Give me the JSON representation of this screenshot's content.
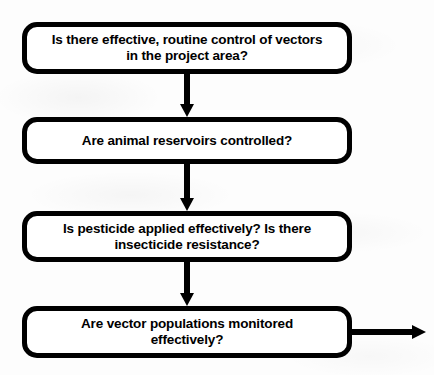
{
  "diagram": {
    "type": "flowchart",
    "background_color": "#fdfdfd",
    "stroke_color": "#000000",
    "fill_color": "#ffffff",
    "nodes": [
      {
        "id": "node-vector-control",
        "shape": "rounded-rectangle",
        "label": "Is there effective, routine control of vectors\nin the project area?",
        "x": 22,
        "y": 22,
        "width": 330,
        "height": 52
      },
      {
        "id": "node-animal-reservoirs",
        "shape": "rounded-rectangle",
        "label": "Are animal reservoirs controlled?",
        "x": 22,
        "y": 117,
        "width": 330,
        "height": 47
      },
      {
        "id": "node-pesticide-applied",
        "shape": "rounded-rectangle",
        "label": "Is pesticide applied effectively? Is there\ninsecticide resistance?",
        "x": 22,
        "y": 211,
        "width": 330,
        "height": 51
      },
      {
        "id": "node-vector-monitoring",
        "shape": "rounded-rectangle",
        "label": "Are vector populations monitored\neffectively?",
        "x": 22,
        "y": 306,
        "width": 330,
        "height": 52
      }
    ],
    "connectors": [
      {
        "id": "arrow-1-to-2",
        "direction": "down",
        "from": "node-vector-control",
        "to": "node-animal-reservoirs",
        "x": 184,
        "y": 74,
        "length": 43
      },
      {
        "id": "arrow-2-to-3",
        "direction": "down",
        "from": "node-animal-reservoirs",
        "to": "node-pesticide-applied",
        "x": 184,
        "y": 164,
        "length": 47
      },
      {
        "id": "arrow-3-to-4",
        "direction": "down",
        "from": "node-pesticide-applied",
        "to": "node-vector-monitoring",
        "x": 184,
        "y": 262,
        "length": 44
      },
      {
        "id": "arrow-4-exit",
        "direction": "right",
        "from": "node-vector-monitoring",
        "to": "",
        "x": 352,
        "y": 329,
        "length": 60
      }
    ]
  }
}
